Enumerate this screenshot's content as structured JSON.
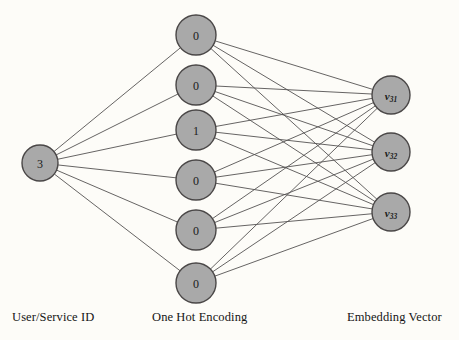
{
  "diagram": {
    "background_color": "#fdfcf8",
    "node_fill_color": "#a9a9a9",
    "node_stroke_color": "#4a4747",
    "edge_color": "#555252",
    "layers": [
      {
        "id": "input",
        "caption": "User/Service ID",
        "caption_x": 12,
        "caption_y": 310,
        "node_radius": 18,
        "nodes": [
          {
            "id": "in-0",
            "label": "3",
            "cx": 40,
            "cy": 163
          }
        ]
      },
      {
        "id": "hidden",
        "caption": "One Hot Encoding",
        "caption_x": 152,
        "caption_y": 310,
        "node_radius": 20,
        "nodes": [
          {
            "id": "oh-0",
            "label": "0",
            "cx": 196,
            "cy": 35
          },
          {
            "id": "oh-1",
            "label": "0",
            "cx": 196,
            "cy": 85
          },
          {
            "id": "oh-2",
            "label": "1",
            "cx": 196,
            "cy": 130
          },
          {
            "id": "oh-3",
            "label": "0",
            "cx": 196,
            "cy": 180
          },
          {
            "id": "oh-4",
            "label": "0",
            "cx": 196,
            "cy": 230
          },
          {
            "id": "oh-5",
            "label": "0",
            "cx": 196,
            "cy": 283
          }
        ]
      },
      {
        "id": "output",
        "caption": "Embedding Vector",
        "caption_x": 347,
        "caption_y": 310,
        "node_radius": 19,
        "nodes": [
          {
            "id": "ev-0",
            "label": "v",
            "sub": "31",
            "cx": 391,
            "cy": 95
          },
          {
            "id": "ev-1",
            "label": "v",
            "sub": "32",
            "cx": 391,
            "cy": 152
          },
          {
            "id": "ev-2",
            "label": "v",
            "sub": "33",
            "cx": 391,
            "cy": 212
          }
        ]
      }
    ],
    "connections": {
      "input_to_hidden": "fully-connected",
      "hidden_to_output": "fully-connected"
    }
  }
}
